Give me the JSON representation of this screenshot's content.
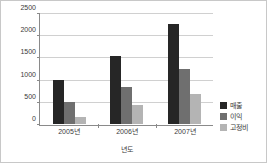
{
  "chart_data": {
    "type": "bar",
    "title": "",
    "xlabel": "년도",
    "ylabel": "",
    "categories": [
      "2005년",
      "2006년",
      "2007년"
    ],
    "series": [
      {
        "name": "매출",
        "color": "#262626",
        "values": [
          1000,
          1550,
          2270
        ]
      },
      {
        "name": "이익",
        "color": "#6f6f6f",
        "values": [
          500,
          850,
          1250
        ]
      },
      {
        "name": "고정비",
        "color": "#b4b4b4",
        "values": [
          150,
          430,
          690
        ]
      }
    ],
    "ylim": [
      0,
      2500
    ],
    "yticks": [
      0,
      500,
      1000,
      1500,
      2000,
      2500
    ],
    "ytick_labels": [
      "0",
      "500",
      "1000",
      "1500",
      "2000",
      "2500"
    ],
    "grid": true,
    "legend_position": "right"
  }
}
